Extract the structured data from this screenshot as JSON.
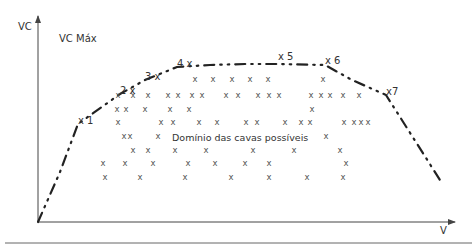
{
  "diagram": {
    "y_axis_label": "VC",
    "x_axis_label": "V",
    "max_label": "VC Máx",
    "region_label": "Domínio das cavas possíveis",
    "colors": {
      "axis": "#444444",
      "curve": "#222222",
      "marks": "#555555",
      "text": "#333333",
      "separator": "#666666"
    },
    "points": [
      {
        "id": "1",
        "label": "x 1",
        "x": 78,
        "y": 124
      },
      {
        "id": "2",
        "label": "2 x",
        "x": 120,
        "y": 94
      },
      {
        "id": "3",
        "label": "3 x",
        "x": 145,
        "y": 80
      },
      {
        "id": "4",
        "label": "4 x",
        "x": 177,
        "y": 67
      },
      {
        "id": "5",
        "label": "x 5",
        "x": 278,
        "y": 60
      },
      {
        "id": "6",
        "label": "x 6",
        "x": 325,
        "y": 64
      },
      {
        "id": "7",
        "label": "x7",
        "x": 386,
        "y": 95
      }
    ],
    "curve_path": [
      [
        38,
        222
      ],
      [
        60,
        172
      ],
      [
        78,
        124
      ],
      [
        120,
        94
      ],
      [
        145,
        80
      ],
      [
        177,
        67
      ],
      [
        210,
        65
      ],
      [
        245,
        64
      ],
      [
        278,
        64
      ],
      [
        325,
        65
      ],
      [
        352,
        80
      ],
      [
        386,
        95
      ],
      [
        440,
        180
      ]
    ],
    "marks": [
      [
        195,
        82
      ],
      [
        213,
        82
      ],
      [
        232,
        82
      ],
      [
        250,
        82
      ],
      [
        268,
        82
      ],
      [
        323,
        82
      ],
      [
        118,
        98
      ],
      [
        133,
        98
      ],
      [
        148,
        98
      ],
      [
        168,
        98
      ],
      [
        178,
        98
      ],
      [
        192,
        98
      ],
      [
        202,
        98
      ],
      [
        226,
        98
      ],
      [
        238,
        98
      ],
      [
        258,
        98
      ],
      [
        269,
        98
      ],
      [
        279,
        98
      ],
      [
        311,
        98
      ],
      [
        321,
        98
      ],
      [
        330,
        98
      ],
      [
        343,
        98
      ],
      [
        359,
        98
      ],
      [
        117,
        112
      ],
      [
        126,
        112
      ],
      [
        145,
        112
      ],
      [
        170,
        112
      ],
      [
        189,
        112
      ],
      [
        312,
        112
      ],
      [
        118,
        125
      ],
      [
        161,
        125
      ],
      [
        173,
        125
      ],
      [
        199,
        125
      ],
      [
        217,
        125
      ],
      [
        246,
        125
      ],
      [
        257,
        125
      ],
      [
        285,
        125
      ],
      [
        301,
        125
      ],
      [
        310,
        125
      ],
      [
        344,
        125
      ],
      [
        354,
        125
      ],
      [
        361,
        125
      ],
      [
        368,
        125
      ],
      [
        124,
        139
      ],
      [
        130,
        139
      ],
      [
        158,
        139
      ],
      [
        326,
        139
      ],
      [
        133,
        153
      ],
      [
        148,
        153
      ],
      [
        175,
        153
      ],
      [
        206,
        153
      ],
      [
        253,
        153
      ],
      [
        294,
        153
      ],
      [
        340,
        153
      ],
      [
        103,
        166
      ],
      [
        125,
        166
      ],
      [
        153,
        166
      ],
      [
        188,
        166
      ],
      [
        215,
        166
      ],
      [
        245,
        166
      ],
      [
        269,
        166
      ],
      [
        346,
        166
      ],
      [
        105,
        180
      ],
      [
        140,
        180
      ],
      [
        185,
        180
      ],
      [
        231,
        180
      ],
      [
        269,
        180
      ],
      [
        307,
        180
      ],
      [
        343,
        180
      ]
    ]
  }
}
